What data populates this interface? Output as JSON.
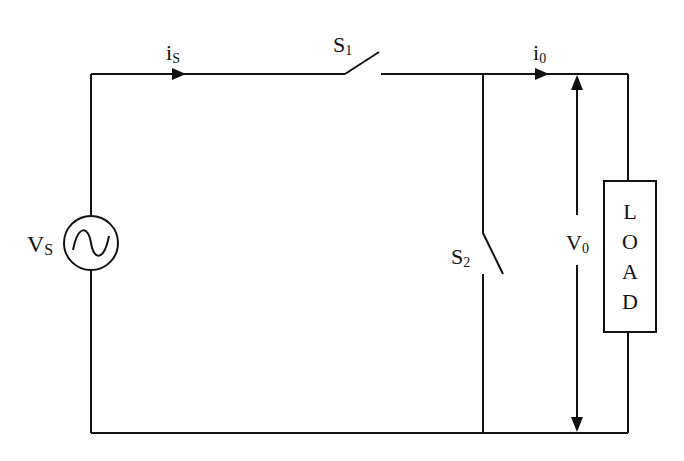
{
  "diagram": {
    "type": "circuit",
    "labels": {
      "source_current": {
        "main": "i",
        "sub": "S"
      },
      "switch1": {
        "main": "S",
        "sub": "1"
      },
      "output_current": {
        "main": "i",
        "sub": "0"
      },
      "source_voltage": {
        "main": "V",
        "sub": "S"
      },
      "switch2": {
        "main": "S",
        "sub": "2"
      },
      "output_voltage": {
        "main": "V",
        "sub": "0"
      }
    },
    "load": {
      "letters": [
        "L",
        "O",
        "A",
        "D"
      ]
    },
    "colors": {
      "line": "#111111",
      "background": "#ffffff"
    }
  }
}
